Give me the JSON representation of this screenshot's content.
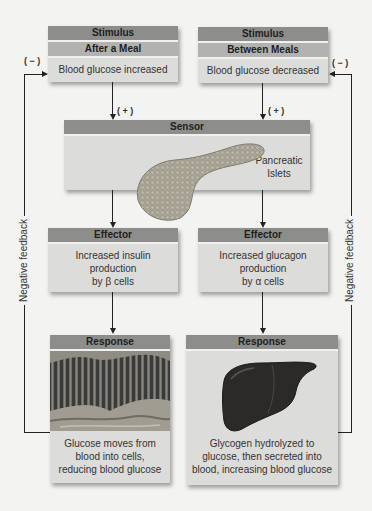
{
  "stimulus_left": {
    "header": "Stimulus",
    "subheader": "After a Meal",
    "text": "Blood glucose increased"
  },
  "stimulus_right": {
    "header": "Stimulus",
    "subheader": "Between Meals",
    "text": "Blood glucose decreased"
  },
  "signs": {
    "positive": "( + )",
    "negative": "( − )"
  },
  "sensor": {
    "header": "Sensor",
    "label_line1": "Pancreatic",
    "label_line2": "Islets",
    "image": "pancreas-illustration"
  },
  "effector_left": {
    "header": "Effector",
    "line1": "Increased insulin",
    "line2": "production",
    "line3": "by β cells"
  },
  "effector_right": {
    "header": "Effector",
    "line1": "Increased glucagon",
    "line2": "production",
    "line3": "by α cells"
  },
  "response_left": {
    "header": "Response",
    "image": "intestinal-tissue-illustration",
    "line1": "Glucose moves from",
    "line2": "blood into cells,",
    "line3": "reducing blood glucose"
  },
  "response_right": {
    "header": "Response",
    "image": "liver-illustration",
    "line1": "Glycogen hydrolyzed to",
    "line2": "glucose, then secreted into",
    "line3": "blood, increasing blood glucose"
  },
  "feedback": {
    "left_label": "Negative feedback",
    "right_label": "Negative feedback"
  },
  "colors": {
    "header_bar": "#8d8d8b",
    "subheader_bar": "#b2b2b0",
    "box_body": "#dcdcda",
    "background": "#f3f3f1",
    "line": "#222222"
  }
}
